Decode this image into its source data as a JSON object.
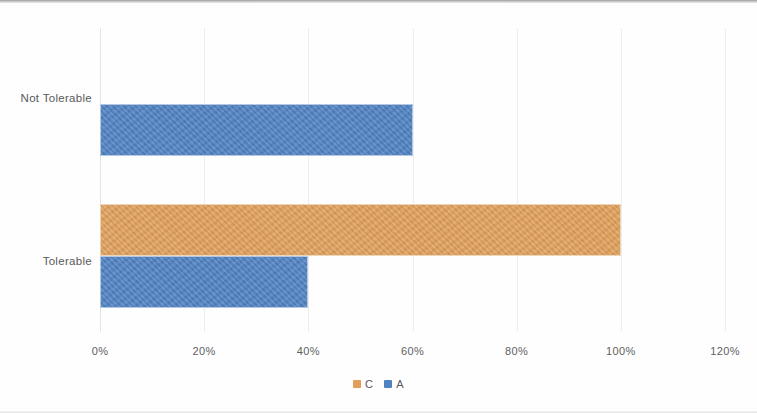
{
  "chart_data": {
    "type": "bar",
    "orientation": "horizontal",
    "title": "",
    "xlabel": "",
    "ylabel": "",
    "categories": [
      "Not Tolerable",
      "Tolerable"
    ],
    "series": [
      {
        "name": "C",
        "color": "#e0a05a",
        "values": [
          0,
          100
        ]
      },
      {
        "name": "A",
        "color": "#5183c3",
        "values": [
          60,
          40
        ]
      }
    ],
    "xlim": [
      0,
      120
    ],
    "xtick_values": [
      0,
      20,
      40,
      60,
      80,
      100,
      120
    ],
    "xtick_labels": [
      "0%",
      "20%",
      "40%",
      "60%",
      "80%",
      "100%",
      "120%"
    ],
    "grid": true,
    "grid_axis": "x",
    "legend": true,
    "legend_position": "bottom",
    "legend_entries": [
      "C",
      "A"
    ],
    "value_labels_shown": false,
    "axis_label_color": "#5a5a5a",
    "gridline_color": "#eceff1",
    "background": "#ffffff"
  }
}
